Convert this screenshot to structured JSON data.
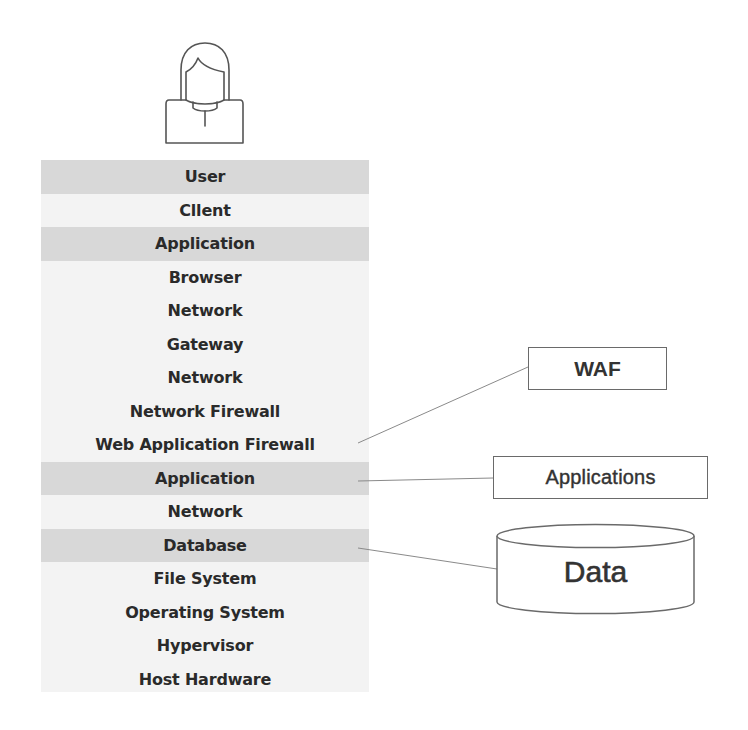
{
  "diagram": {
    "actor": {
      "icon": "user-avatar-icon"
    },
    "stack_layers": [
      {
        "label": "User",
        "shaded": true
      },
      {
        "label": "Cllent",
        "shaded": false
      },
      {
        "label": "Application",
        "shaded": true
      },
      {
        "label": "Browser",
        "shaded": false
      },
      {
        "label": "Network",
        "shaded": false
      },
      {
        "label": "Gateway",
        "shaded": false
      },
      {
        "label": "Network",
        "shaded": false
      },
      {
        "label": "Network Firewall",
        "shaded": false
      },
      {
        "label": "Web Application Firewall",
        "shaded": false
      },
      {
        "label": "Application",
        "shaded": true
      },
      {
        "label": "Network",
        "shaded": false
      },
      {
        "label": "Database",
        "shaded": true
      },
      {
        "label": "File System",
        "shaded": false
      },
      {
        "label": "Operating System",
        "shaded": false
      },
      {
        "label": "Hypervisor",
        "shaded": false
      },
      {
        "label": "Host Hardware",
        "shaded": false
      }
    ],
    "callouts": {
      "waf": {
        "label": "WAF",
        "connects_to": "Web Application Firewall"
      },
      "applications": {
        "label": "Applications",
        "connects_to": "Application"
      },
      "data": {
        "label": "Data",
        "shape": "cylinder",
        "connects_to": "Database"
      }
    },
    "colors": {
      "shaded_row": "#d8d8d8",
      "stack_background": "#f3f3f3",
      "line": "#8a8a8a",
      "text": "#2a2a2a"
    }
  }
}
